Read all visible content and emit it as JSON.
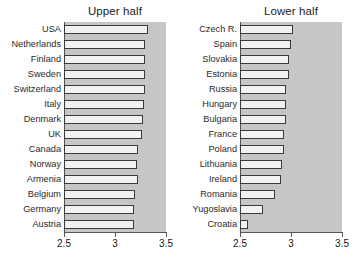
{
  "figure": {
    "background": "#ffffff",
    "plot_background": "#c6c6c6",
    "bar_fill": "#f2f2f0",
    "bar_edge": "#3a3a3a",
    "axis_color": "#555555"
  },
  "chart_data": [
    {
      "type": "bar",
      "title": "Upper half",
      "orientation": "horizontal",
      "xlabel": "",
      "ylabel": "",
      "xlim": [
        2.5,
        3.5
      ],
      "grid": false,
      "legend": null,
      "xticks": [
        "2.5",
        "3",
        "3.5"
      ],
      "xtick_values": [
        2.5,
        3,
        3.5
      ],
      "categories": [
        "USA",
        "Netherlands",
        "Finland",
        "Sweden",
        "Switzerland",
        "Italy",
        "Denmark",
        "UK",
        "Canada",
        "Norway",
        "Armenia",
        "Belgium",
        "Germany",
        "Austria"
      ],
      "values": [
        3.32,
        3.29,
        3.29,
        3.29,
        3.29,
        3.28,
        3.27,
        3.26,
        3.23,
        3.22,
        3.23,
        3.2,
        3.19,
        3.19
      ]
    },
    {
      "type": "bar",
      "title": "Lower half",
      "orientation": "horizontal",
      "xlabel": "",
      "ylabel": "",
      "xlim": [
        2.5,
        3.5
      ],
      "grid": false,
      "legend": null,
      "xticks": [
        "2.5",
        "3",
        "3.5"
      ],
      "xtick_values": [
        2.5,
        3,
        3.5
      ],
      "categories": [
        "Czech R.",
        "Spain",
        "Slovakia",
        "Estonia",
        "Russia",
        "Hungary",
        "Bulgaria",
        "France",
        "Poland",
        "Lithuania",
        "Ireland",
        "Romania",
        "Yugoslavia",
        "Croatia"
      ],
      "values": [
        3.02,
        3.0,
        2.98,
        2.98,
        2.95,
        2.95,
        2.95,
        2.93,
        2.93,
        2.91,
        2.9,
        2.84,
        2.73,
        2.58
      ]
    }
  ]
}
